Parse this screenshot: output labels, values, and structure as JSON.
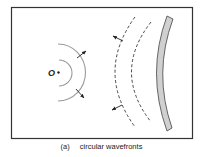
{
  "figure": {
    "tag": "(a)",
    "caption": "circular wavefronts",
    "source_label": "O"
  },
  "colors": {
    "frame": "#333333",
    "incident_wave": "#9a9a9a",
    "reflected_wave": "#333333",
    "mirror_fill": "#d0d0d0",
    "mirror_stroke": "#555555",
    "arrow": "#222222"
  },
  "elements": {
    "incident_wavefronts": 2,
    "reflected_wavefronts": 2,
    "mirror": "concave curved reflector"
  }
}
